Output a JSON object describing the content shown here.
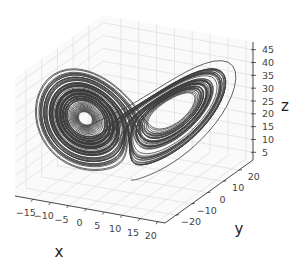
{
  "chart_data": {
    "type": "line3d",
    "title": "",
    "xlabel": "x",
    "ylabel": "y",
    "zlabel": "z",
    "xlim": [
      -20,
      22
    ],
    "ylim": [
      -27,
      29
    ],
    "zlim": [
      2,
      48
    ],
    "xticks": [
      -15,
      -10,
      -5,
      0,
      5,
      10,
      15,
      20
    ],
    "yticks": [
      -20,
      -10,
      0,
      10,
      20
    ],
    "zticks": [
      5,
      10,
      15,
      20,
      25,
      30,
      35,
      40,
      45
    ],
    "xtick_labels": [
      "−15",
      "−10",
      "−5",
      "0",
      "5",
      "10",
      "15",
      "20"
    ],
    "ytick_labels": [
      "−20",
      "−10",
      "0",
      "10",
      "20"
    ],
    "ztick_labels": [
      "5",
      "10",
      "15",
      "20",
      "25",
      "30",
      "35",
      "40",
      "45"
    ],
    "grid": true,
    "legend": null,
    "series": [
      {
        "name": "trajectory",
        "system": "lorenz",
        "sigma": 10,
        "rho": 28,
        "beta": 2.6667,
        "initial": [
          0.0,
          1.0,
          1.05
        ],
        "dt": 0.01,
        "steps": 10000,
        "color": "#3c3c3c"
      }
    ]
  }
}
